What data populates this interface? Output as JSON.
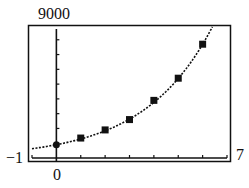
{
  "chart_data": {
    "type": "scatter",
    "title": "",
    "xlabel": "",
    "ylabel": "",
    "xlim": [
      -1,
      7
    ],
    "ylim": [
      0,
      9000
    ],
    "x_tick_step": 1,
    "y_tick_step": 1000,
    "grid": false,
    "legend": "none",
    "window_labels": {
      "xmin": "−1",
      "xmax": "7",
      "ymax": "9000",
      "origin": "0"
    },
    "series": [
      {
        "name": "data points",
        "marker": "square",
        "x": [
          0,
          1,
          2,
          3,
          4,
          5,
          6
        ],
        "y": [
          900,
          1350,
          1900,
          2600,
          3900,
          5400,
          7700
        ]
      },
      {
        "name": "exponential model",
        "style": "dotted-curve",
        "model": "y = 900 * 1.43^x",
        "x_range": [
          -1,
          6.6
        ]
      }
    ]
  }
}
